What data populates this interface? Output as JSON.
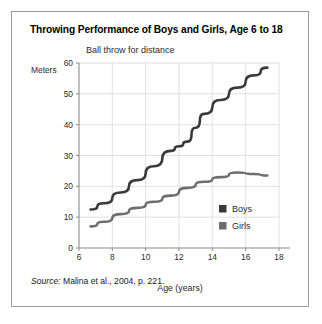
{
  "figure": {
    "title": "Throwing Performance of Boys and Girls, Age 6 to 18",
    "subtitle": "Ball throw for distance",
    "unit_label": "Meters",
    "source_key": "Source:",
    "source_text": " Malina et al., 2004, p. 221."
  },
  "colors": {
    "boys": "#3a3a3a",
    "girls": "#6e6e6e",
    "grid": "#d8d8d8",
    "axis": "#8c8c8c",
    "border": "#9a9a9a",
    "background": "#ffffff"
  },
  "chart_data": {
    "type": "line",
    "title": "Throwing Performance of Boys and Girls, Age 6 to 18",
    "subtitle": "Ball throw for distance",
    "xlabel": "Age (years)",
    "ylabel": "Meters",
    "xlim": [
      6,
      18
    ],
    "ylim": [
      0,
      60
    ],
    "xticks": [
      6,
      8,
      10,
      12,
      14,
      16,
      18
    ],
    "yticks": [
      0,
      10,
      20,
      30,
      40,
      50,
      60
    ],
    "grid": true,
    "legend_position": "inside-lower-right",
    "series": [
      {
        "name": "Boys",
        "color": "#3a3a3a",
        "x": [
          6.7,
          7.5,
          8.5,
          9.5,
          10.5,
          11.5,
          12.0,
          12.5,
          13.0,
          13.5,
          14.5,
          15.5,
          16.5,
          17.3
        ],
        "values": [
          12.5,
          14.5,
          18.0,
          22.0,
          26.5,
          31.5,
          33.0,
          34.5,
          39.0,
          43.5,
          48.0,
          52.0,
          56.0,
          58.5
        ]
      },
      {
        "name": "Girls",
        "color": "#6e6e6e",
        "x": [
          6.7,
          7.5,
          8.5,
          9.5,
          10.5,
          11.5,
          12.5,
          13.5,
          14.5,
          15.5,
          16.5,
          17.3
        ],
        "values": [
          7.0,
          8.5,
          11.0,
          13.0,
          15.0,
          17.0,
          19.5,
          21.5,
          23.0,
          24.5,
          24.0,
          23.5
        ]
      }
    ]
  },
  "legend": {
    "items": [
      {
        "label": "Boys",
        "color": "#3a3a3a"
      },
      {
        "label": "Girls",
        "color": "#6e6e6e"
      }
    ]
  },
  "axes": {
    "x_title": "Age (years)",
    "x_tick_labels": [
      "6",
      "8",
      "10",
      "12",
      "14",
      "16",
      "18"
    ],
    "y_tick_labels": [
      "0",
      "10",
      "20",
      "30",
      "40",
      "50",
      "60"
    ]
  }
}
